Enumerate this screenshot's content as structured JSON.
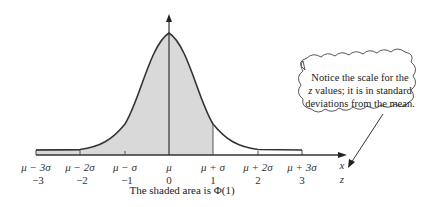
{
  "diagram": {
    "caption": "The shaded area is Φ(1)",
    "shaded_up_to_z": 1,
    "x_axis_label": "x",
    "z_axis_label": "z",
    "x_ticks": [
      "μ − 3σ",
      "μ − 2σ",
      "μ − σ",
      "μ",
      "μ + σ",
      "μ + 2σ",
      "μ + 3σ"
    ],
    "z_ticks": [
      "−3",
      "−2",
      "−1",
      "0",
      "1",
      "2",
      "3"
    ],
    "callout": {
      "line1": "Notice the scale for the",
      "line2_var": "z",
      "line2_rest": " values; it is in standard",
      "line3": "deviations from the mean."
    },
    "colors": {
      "shade": "#d9d9d9",
      "curve": "#333333",
      "axis": "#333333"
    }
  }
}
